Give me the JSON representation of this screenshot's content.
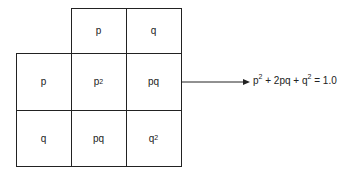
{
  "diagram": {
    "column_headers": [
      "p",
      "q"
    ],
    "row_headers": [
      "p",
      "q"
    ],
    "cells": [
      [
        {
          "base": "p",
          "sup": "2"
        },
        {
          "base": "pq",
          "sup": ""
        }
      ],
      [
        {
          "base": "pq",
          "sup": ""
        },
        {
          "base": "q",
          "sup": "2"
        }
      ]
    ],
    "equation": {
      "t1": "p",
      "s1": "2",
      "t2": " + 2pq + q",
      "s2": "2",
      "t3": " = 1.0"
    },
    "colors": {
      "line": "#222222",
      "background": "#ffffff"
    }
  }
}
